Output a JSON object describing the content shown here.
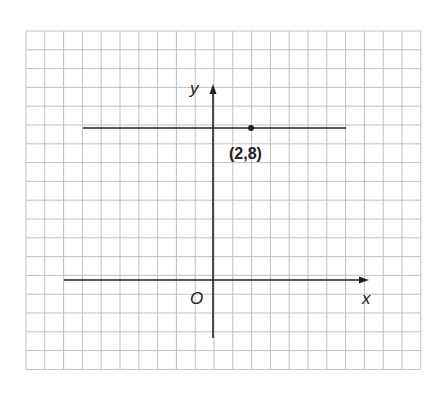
{
  "diagram": {
    "type": "coordinate-grid",
    "grid": {
      "left": 26,
      "top": 31,
      "cols": 21,
      "rows": 18,
      "cell": 18.8,
      "color": "#b8b8b8"
    },
    "origin_px": {
      "x": 213,
      "y": 280
    },
    "unit_px": 19,
    "axes": {
      "x_label": "x",
      "y_label": "y",
      "origin_label": "O"
    },
    "line": {
      "equation": "y = 8",
      "x_from": -7,
      "x_to": 7
    },
    "point": {
      "x": 2,
      "y": 8,
      "label": "(2,8)"
    },
    "colors": {
      "ink": "#222222",
      "grid": "#b8b8b8"
    }
  }
}
